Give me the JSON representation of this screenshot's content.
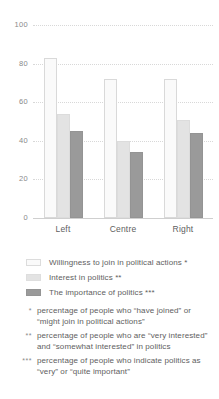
{
  "chart_data": {
    "type": "bar",
    "title": "",
    "xlabel": "",
    "ylabel": "",
    "ylim": [
      0,
      100
    ],
    "yticks": [
      0,
      20,
      40,
      60,
      80,
      100
    ],
    "grid": true,
    "legend_position": "below",
    "categories": [
      "Left",
      "Centre",
      "Right"
    ],
    "series": [
      {
        "name": "Willingness to join in political actions *",
        "color": "#fafafa",
        "values": [
          83,
          72,
          72
        ]
      },
      {
        "name": "Interest in politics **",
        "color": "#e3e3e3",
        "values": [
          54,
          40,
          51
        ]
      },
      {
        "name": "The importance of politics ***",
        "color": "#9a9a9a",
        "values": [
          45,
          34,
          44
        ]
      }
    ],
    "annotations": [
      {
        "mark": "*",
        "text": "percentage of people who “have joined” or “might join in political actions”"
      },
      {
        "mark": "**",
        "text": "percentage of people who are “very interested” and “somewhat interested” in politics"
      },
      {
        "mark": "***",
        "text": "percentage of people who indicate politics as “very” or “quite important”"
      }
    ]
  }
}
